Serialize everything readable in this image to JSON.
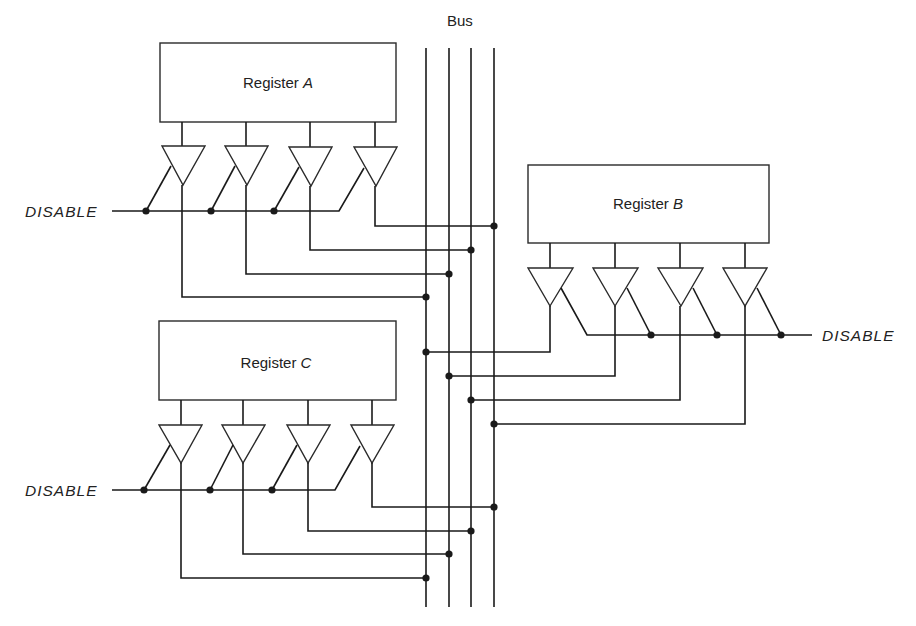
{
  "diagram": {
    "bus": {
      "label": "Bus",
      "line_count": 4
    },
    "registers": [
      {
        "id": "A",
        "prefix": "Register ",
        "letter": "A"
      },
      {
        "id": "B",
        "prefix": "Register ",
        "letter": "B"
      },
      {
        "id": "C",
        "prefix": "Register ",
        "letter": "C"
      }
    ],
    "disable_labels": [
      {
        "register": "A",
        "text": "DISABLE"
      },
      {
        "register": "B",
        "text": "DISABLE"
      },
      {
        "register": "C",
        "text": "DISABLE"
      }
    ],
    "buffers_per_register": 4,
    "colors": {
      "line": "#1a1a1a",
      "background": "#ffffff"
    }
  }
}
